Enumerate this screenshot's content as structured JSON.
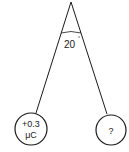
{
  "diagram": {
    "type": "physics-pendulum-charges",
    "angle_label": "20",
    "angle_unit": "°",
    "left_sphere": {
      "charge_line1": "+0.3",
      "charge_line2": "μC"
    },
    "right_sphere": {
      "charge": "?"
    },
    "colors": {
      "stroke": "#1a1a1a",
      "background": "#ffffff"
    }
  }
}
